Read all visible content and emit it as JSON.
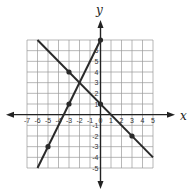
{
  "chart_data": {
    "type": "line",
    "title": "",
    "xlabel": "x",
    "ylabel": "y",
    "xlim": [
      -7,
      5
    ],
    "ylim": [
      -5,
      7
    ],
    "grid": true,
    "x_ticks": [
      -7,
      -6,
      -5,
      -4,
      -3,
      -2,
      -1,
      0,
      1,
      2,
      3,
      4,
      5
    ],
    "y_ticks": [
      -5,
      -4,
      -3,
      -2,
      -1,
      1,
      2,
      3,
      4,
      5,
      6
    ],
    "series": [
      {
        "name": "line-decreasing",
        "equation": "y = -x + 1",
        "segment": [
          [
            -6,
            7
          ],
          [
            5,
            -4
          ]
        ],
        "points": [
          [
            -3,
            4
          ],
          [
            0,
            1
          ],
          [
            3,
            -2
          ]
        ]
      },
      {
        "name": "line-increasing",
        "equation": "y = 2x + 7",
        "segment": [
          [
            -6,
            -5
          ],
          [
            0,
            7
          ]
        ],
        "points": [
          [
            -5,
            -3
          ],
          [
            -3,
            1
          ],
          [
            0,
            7
          ]
        ]
      }
    ],
    "intersection": [
      -2,
      3
    ]
  },
  "colors": {
    "grid": "#9a9a9a",
    "axis": "#222222",
    "line": "#2a2a2a"
  }
}
